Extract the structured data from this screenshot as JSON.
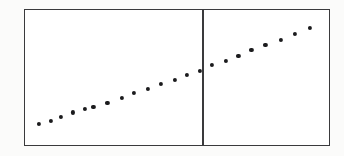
{
  "figure": {
    "background_color": "#fbfbfa",
    "panel_color": "#ffffff",
    "frame_color": "#3a3a3c",
    "marker_color": "#1b1b1d",
    "divider_color": "#3a3a3c"
  },
  "chart_data": {
    "type": "scatter",
    "title": "",
    "subtitle": "",
    "xlabel": "",
    "ylabel": "",
    "xlim": [
      0,
      100
    ],
    "ylim": [
      0,
      100
    ],
    "grid": false,
    "legend": null,
    "legend_position": "none",
    "axis_ticks": {
      "x": [],
      "y": []
    },
    "annotations": [
      {
        "name": "vertical-divider",
        "type": "vline",
        "x": 58.2,
        "label": ""
      }
    ],
    "series": [
      {
        "name": "points",
        "marker": "circle",
        "color": "#1b1b1d",
        "x": [
          4.6,
          8.5,
          11.8,
          15.7,
          19.6,
          22.5,
          27.1,
          32.0,
          35.9,
          40.5,
          44.8,
          49.4,
          53.3,
          57.5,
          61.4,
          66.0,
          70.2,
          74.5,
          79.1,
          84.3,
          88.9,
          93.8
        ],
        "y": [
          15.4,
          17.8,
          21.0,
          24.2,
          26.6,
          28.2,
          31.4,
          34.7,
          38.6,
          41.8,
          45.0,
          48.3,
          52.2,
          54.6,
          59.2,
          62.4,
          65.7,
          70.3,
          74.2,
          78.1,
          82.0,
          86.6
        ]
      }
    ]
  }
}
